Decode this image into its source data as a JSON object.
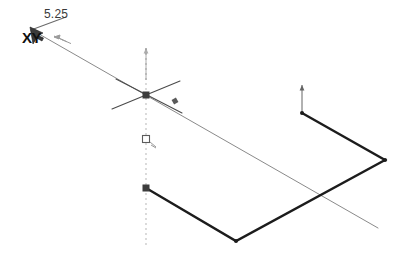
{
  "app": {
    "title": "CAD Sketch Viewport",
    "background_color": "#ffffff"
  },
  "annotations": {
    "dimension_value": "5.25",
    "plane_label": "XY"
  },
  "colors": {
    "construction_line": "#8a8a8a",
    "centerline": "#b9b9b9",
    "profile_line": "#1c1c1c",
    "vertex_marker": "#3d3d3d",
    "text": "#3a3a3a",
    "label_bold": "#101010"
  },
  "geometry": {
    "construction_line": {
      "name": "diagonal-construction-line",
      "x1": 32,
      "y1": 30,
      "x2": 378,
      "y2": 228,
      "width": 1.0
    },
    "centerline": {
      "name": "vertical-centerline",
      "x": 146,
      "y1": 48,
      "y2": 248,
      "dash": "2 3"
    },
    "crosshair": {
      "name": "origin-crosshair",
      "cx": 146,
      "cy": 95,
      "arm1": {
        "x1": 112,
        "y1": 109,
        "x2": 180,
        "y2": 81
      },
      "arm2": {
        "x1": 116,
        "y1": 79,
        "x2": 182,
        "y2": 113
      }
    },
    "profile_polyline": {
      "name": "sketch-profile",
      "points": [
        {
          "x": 146,
          "y": 188
        },
        {
          "x": 236,
          "y": 241
        },
        {
          "x": 385,
          "y": 160
        },
        {
          "x": 302,
          "y": 113
        }
      ],
      "width": 2.4
    },
    "vertex_markers": [
      {
        "name": "vertex-origin",
        "x": 146,
        "y": 95,
        "shape": "square",
        "size": 7
      },
      {
        "name": "vertex-profile-start",
        "x": 146,
        "y": 188,
        "shape": "square",
        "size": 7
      },
      {
        "name": "vertex-profile-bottom",
        "x": 236,
        "y": 241,
        "shape": "dot",
        "size": 4
      },
      {
        "name": "vertex-profile-right",
        "x": 385,
        "y": 160,
        "shape": "dot",
        "size": 4
      },
      {
        "name": "vertex-profile-end",
        "x": 302,
        "y": 113,
        "shape": "dot",
        "size": 4
      }
    ],
    "circle_constraint": {
      "name": "coincident-constraint-marker",
      "x": 146,
      "y": 139,
      "size": 7
    },
    "midpoint_marker": {
      "name": "midpoint-constraint-marker",
      "x": 175,
      "y": 101,
      "size": 5
    },
    "up_arrows": [
      {
        "name": "origin-axis-arrow",
        "x": 146,
        "y_tip": 48,
        "y_base": 80,
        "opacity": 0.45
      },
      {
        "name": "profile-axis-arrow",
        "x": 302,
        "y_tip": 85,
        "y_base": 112,
        "opacity": 0.85
      }
    ],
    "leader_arrow": {
      "name": "dimension-leader",
      "x1": 66,
      "y1": 17,
      "x2": 31,
      "y2": 30
    },
    "cursor": {
      "name": "mouse-cursor-arrow",
      "x": 30,
      "y": 27
    },
    "drag_glyph": {
      "name": "drag-ghost-arrows",
      "x": 54,
      "y": 36
    }
  }
}
